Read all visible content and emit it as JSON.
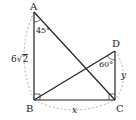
{
  "diagram": {
    "points": {
      "A": {
        "label": "A",
        "x": 34,
        "y": 12
      },
      "B": {
        "label": "B",
        "x": 34,
        "y": 100
      },
      "C": {
        "label": "C",
        "x": 115,
        "y": 100
      },
      "D": {
        "label": "D",
        "x": 115,
        "y": 51
      }
    },
    "segments": [
      "AB",
      "BC",
      "AC",
      "BD",
      "DC"
    ],
    "angles": {
      "A": {
        "label": "45°"
      },
      "D": {
        "label": "60°"
      }
    },
    "right_angles": [
      "B",
      "C"
    ],
    "lengths": {
      "AB": {
        "label": "6√2",
        "coef": "6",
        "radicand": "2"
      },
      "BC": {
        "label": "x"
      },
      "DC": {
        "label": "y"
      }
    },
    "colors": {
      "line": "#222222",
      "dashed": "#999999",
      "background": "#ffffff"
    }
  }
}
